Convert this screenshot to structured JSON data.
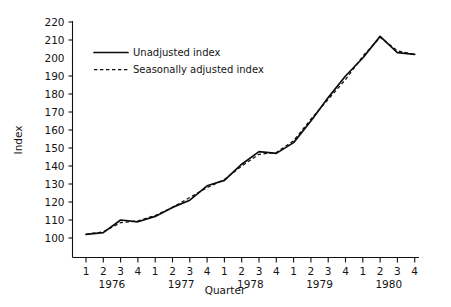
{
  "chart_data": {
    "type": "line",
    "title": "",
    "xlabel": "Quarter",
    "ylabel": "Index",
    "ylim": [
      100,
      220
    ],
    "ytick_step": 10,
    "yticks": [
      100,
      110,
      120,
      130,
      140,
      150,
      160,
      170,
      180,
      190,
      200,
      210,
      220
    ],
    "grid": false,
    "legend_position": "top-left-inside",
    "years": [
      "1976",
      "1977",
      "1978",
      "1979",
      "1980"
    ],
    "quarters": [
      "1",
      "2",
      "3",
      "4"
    ],
    "categories": [
      "1976 Q1",
      "1976 Q2",
      "1976 Q3",
      "1976 Q4",
      "1977 Q1",
      "1977 Q2",
      "1977 Q3",
      "1977 Q4",
      "1978 Q1",
      "1978 Q2",
      "1978 Q3",
      "1978 Q4",
      "1979 Q1",
      "1979 Q2",
      "1979 Q3",
      "1979 Q4",
      "1980 Q1",
      "1980 Q2",
      "1980 Q3",
      "1980 Q4"
    ],
    "series": [
      {
        "name": "Unadjusted index",
        "style": "solid",
        "values": [
          102,
          103,
          110,
          109,
          112,
          117,
          121,
          129,
          132,
          141,
          148,
          147,
          153,
          165,
          178,
          190,
          200,
          212,
          203,
          202
        ]
      },
      {
        "name": "Seasonally adjusted index",
        "style": "dashed",
        "values": [
          102,
          103.5,
          108.5,
          109.5,
          112.5,
          117,
          122.5,
          128,
          132.5,
          140,
          146.5,
          147.5,
          154,
          166,
          177,
          188,
          201,
          211.5,
          204,
          202
        ]
      }
    ]
  },
  "legend": {
    "entries": [
      {
        "label": "Unadjusted index",
        "style": "solid"
      },
      {
        "label": "Seasonally adjusted index",
        "style": "dashed"
      }
    ]
  },
  "axes": {
    "y_title": "Index",
    "x_title": "Quarter"
  }
}
